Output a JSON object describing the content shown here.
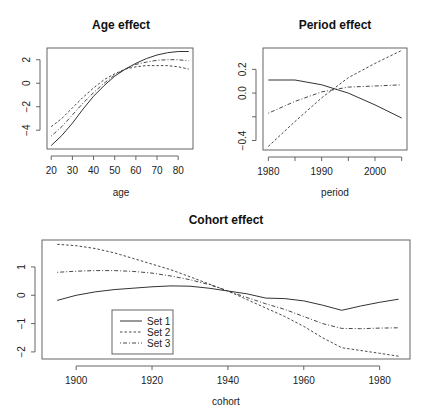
{
  "chart_data": [
    {
      "type": "line",
      "title": "Age effect",
      "xlabel": "age",
      "ylabel": "",
      "xlim": [
        18,
        87
      ],
      "ylim": [
        -5.6,
        3.0
      ],
      "xticks": [
        20,
        30,
        40,
        50,
        60,
        70,
        80
      ],
      "yticks": [
        -4,
        -2,
        0,
        2
      ],
      "grid": false,
      "x": [
        20,
        25,
        30,
        35,
        40,
        45,
        50,
        55,
        60,
        65,
        70,
        75,
        80,
        85
      ],
      "series": [
        {
          "name": "Set 1",
          "style": "solid",
          "values": [
            -5.3,
            -4.45,
            -3.4,
            -2.2,
            -1.1,
            -0.2,
            0.6,
            1.2,
            1.7,
            2.1,
            2.4,
            2.6,
            2.7,
            2.7
          ]
        },
        {
          "name": "Set 2",
          "style": "dashed",
          "values": [
            -3.7,
            -3.0,
            -2.1,
            -1.2,
            -0.4,
            0.3,
            0.8,
            1.2,
            1.4,
            1.5,
            1.5,
            1.5,
            1.4,
            1.2
          ]
        },
        {
          "name": "Set 3",
          "style": "dotdash",
          "values": [
            -4.5,
            -3.7,
            -2.7,
            -1.7,
            -0.8,
            0.0,
            0.7,
            1.2,
            1.6,
            1.8,
            1.95,
            2.0,
            2.0,
            1.9
          ]
        }
      ]
    },
    {
      "type": "line",
      "title": "Period effect",
      "xlabel": "period",
      "ylabel": "",
      "xlim": [
        1979,
        2006
      ],
      "ylim": [
        -0.48,
        0.38
      ],
      "xticks": [
        1980,
        1990,
        2000
      ],
      "xticks_minor": [
        1985,
        1995,
        2005
      ],
      "yticks": [
        -0.4,
        -0.2,
        0.0,
        0.2
      ],
      "ytick_labels": [
        "-0.4",
        "",
        "0.0",
        "0.2"
      ],
      "grid": false,
      "x": [
        1980,
        1985,
        1990,
        1995,
        2000,
        2005
      ],
      "series": [
        {
          "name": "Set 1",
          "style": "solid",
          "values": [
            0.11,
            0.11,
            0.07,
            0.0,
            -0.1,
            -0.21
          ]
        },
        {
          "name": "Set 2",
          "style": "dashed",
          "values": [
            -0.45,
            -0.24,
            -0.04,
            0.13,
            0.25,
            0.36
          ]
        },
        {
          "name": "Set 3",
          "style": "dotdash",
          "values": [
            -0.17,
            -0.07,
            0.01,
            0.05,
            0.06,
            0.07
          ]
        }
      ]
    },
    {
      "type": "line",
      "title": "Cohort effect",
      "xlabel": "cohort",
      "ylabel": "",
      "xlim": [
        1891,
        1988
      ],
      "ylim": [
        -2.25,
        1.95
      ],
      "xticks": [
        1900,
        1920,
        1940,
        1960,
        1980
      ],
      "yticks": [
        -2,
        -1,
        0,
        1
      ],
      "grid": false,
      "legend": {
        "position": "bottomleft-inset",
        "entries": [
          "Set 1",
          "Set 2",
          "Set 3"
        ]
      },
      "x": [
        1895,
        1900,
        1905,
        1910,
        1915,
        1920,
        1925,
        1930,
        1935,
        1940,
        1945,
        1950,
        1955,
        1960,
        1965,
        1970,
        1975,
        1980,
        1985
      ],
      "series": [
        {
          "name": "Set 1",
          "style": "solid",
          "values": [
            -0.18,
            0.0,
            0.12,
            0.2,
            0.25,
            0.3,
            0.33,
            0.32,
            0.25,
            0.15,
            0.05,
            -0.1,
            -0.12,
            -0.2,
            -0.35,
            -0.53,
            -0.38,
            -0.25,
            -0.14
          ]
        },
        {
          "name": "Set 2",
          "style": "dashed",
          "values": [
            1.8,
            1.75,
            1.65,
            1.5,
            1.3,
            1.1,
            0.9,
            0.65,
            0.4,
            0.15,
            -0.15,
            -0.45,
            -0.75,
            -1.1,
            -1.5,
            -1.85,
            -1.95,
            -2.05,
            -2.15
          ]
        },
        {
          "name": "Set 3",
          "style": "dotdash",
          "values": [
            0.81,
            0.85,
            0.87,
            0.87,
            0.84,
            0.78,
            0.68,
            0.55,
            0.38,
            0.15,
            -0.08,
            -0.3,
            -0.5,
            -0.75,
            -1.0,
            -1.17,
            -1.18,
            -1.16,
            -1.15
          ]
        }
      ]
    }
  ],
  "panels": {
    "age": {
      "title": "Age effect",
      "xlabel": "age"
    },
    "period": {
      "title": "Period effect",
      "xlabel": "period"
    },
    "cohort": {
      "title": "Cohort effect",
      "xlabel": "cohort"
    }
  },
  "legend": {
    "entries": [
      {
        "label": "Set 1",
        "style": "solid"
      },
      {
        "label": "Set 2",
        "style": "dashed"
      },
      {
        "label": "Set 3",
        "style": "dotdash"
      }
    ]
  },
  "colors": {
    "line": "#333333",
    "axis": "#555555",
    "text": "#222222",
    "background": "#ffffff"
  }
}
